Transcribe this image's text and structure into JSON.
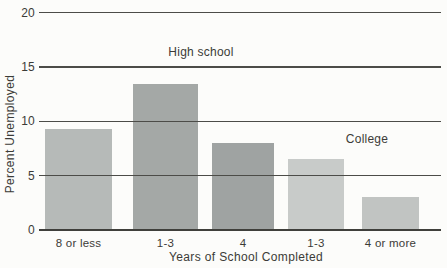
{
  "chart_data": {
    "type": "bar",
    "title": "",
    "xlabel": "Years of School Completed",
    "ylabel": "Percent Unemployed",
    "categories": [
      "8 or less",
      "1-3",
      "4",
      "1-3",
      "4 or more"
    ],
    "values": [
      9.3,
      13.4,
      8.0,
      6.5,
      3.0
    ],
    "ylim": [
      0,
      20
    ],
    "yticks": [
      0,
      5,
      10,
      15,
      20
    ],
    "grid": "horizontal-lines-over-bars",
    "bar_colors": [
      "#b6bab8",
      "#a4a8a6",
      "#9fa3a2",
      "#c8cbc9",
      "#c1c4c2"
    ],
    "line_color": "#4c4c48",
    "text_color": "#3b3b37",
    "background_color": "#fcfcfa",
    "annotations": [
      {
        "text": "High school",
        "covers_categories": [
          "1-3",
          "4"
        ]
      },
      {
        "text": "College",
        "covers_categories": [
          "1-3",
          "4 or more"
        ]
      }
    ]
  }
}
